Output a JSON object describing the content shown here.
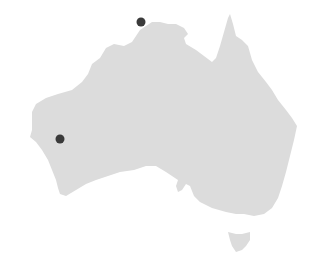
{
  "map": {
    "region": "Australia",
    "land_color": "#dcdcdc",
    "marker_color": "#3a3a3a",
    "markers": [
      {
        "id": "marker-north",
        "x": 141,
        "y": 22,
        "r": 4.5
      },
      {
        "id": "marker-west",
        "x": 60,
        "y": 139,
        "r": 4.5
      }
    ]
  }
}
